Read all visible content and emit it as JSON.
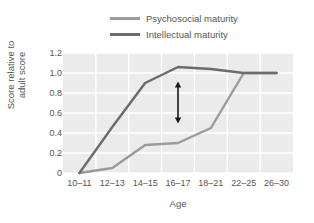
{
  "chart_data": {
    "type": "line",
    "title": "",
    "xlabel": "Age",
    "ylabel": "Score relative to adult score",
    "categories": [
      "10–11",
      "12–13",
      "14–15",
      "16–17",
      "18–21",
      "22–25",
      "26–30"
    ],
    "yticks": [
      "1.2",
      "1.0",
      "0.8",
      "0.6",
      "0.4",
      "0.2",
      "0"
    ],
    "ylim": [
      0,
      1.2
    ],
    "grid": true,
    "legend_position": "top-center",
    "series": [
      {
        "name": "Psychosocial maturity",
        "color": "#9a9a9a",
        "values": [
          0.0,
          0.05,
          0.28,
          0.3,
          0.45,
          1.0,
          1.0
        ]
      },
      {
        "name": "Intellectual maturity",
        "color": "#6b6b6b",
        "values": [
          0.0,
          0.46,
          0.9,
          1.06,
          1.04,
          1.0,
          1.0
        ]
      }
    ],
    "annotations": [
      {
        "type": "double-arrow",
        "category": "16–17",
        "y_top": 0.86,
        "y_bottom": 0.55,
        "color": "#1a1a1a"
      }
    ]
  },
  "ylabel_lines": [
    "Score relative to",
    "adult score"
  ],
  "colors": {
    "plot_background": "#ebebeb",
    "gridline": "#ffffff",
    "text": "#555555",
    "psychosocial": "#9a9a9a",
    "intellectual": "#6b6b6b",
    "annotation": "#1a1a1a"
  }
}
